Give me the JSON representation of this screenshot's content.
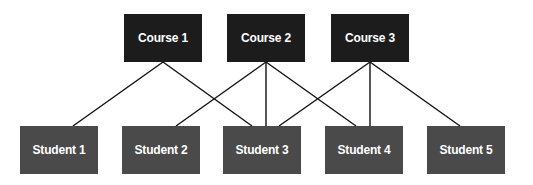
{
  "courses": [
    {
      "label": "Course 1",
      "x": 124,
      "y": 14
    },
    {
      "label": "Course 2",
      "x": 227,
      "y": 14
    },
    {
      "label": "Course 3",
      "x": 331,
      "y": 14
    }
  ],
  "students": [
    {
      "label": "Student 1",
      "x": 20,
      "y": 126
    },
    {
      "label": "Student 2",
      "x": 122,
      "y": 126
    },
    {
      "label": "Student 3",
      "x": 223,
      "y": 126
    },
    {
      "label": "Student 4",
      "x": 325,
      "y": 126
    },
    {
      "label": "Student 5",
      "x": 427,
      "y": 126
    }
  ],
  "edges": [
    {
      "from": "Course 1",
      "to": "Student 1",
      "x1": 163,
      "y1": 62,
      "x2": 73,
      "y2": 126
    },
    {
      "from": "Course 1",
      "to": "Student 3",
      "x1": 163,
      "y1": 62,
      "x2": 252,
      "y2": 126
    },
    {
      "from": "Course 2",
      "to": "Student 2",
      "x1": 266,
      "y1": 62,
      "x2": 176,
      "y2": 126
    },
    {
      "from": "Course 2",
      "to": "Student 3",
      "x1": 266,
      "y1": 62,
      "x2": 266,
      "y2": 126
    },
    {
      "from": "Course 2",
      "to": "Student 4",
      "x1": 266,
      "y1": 62,
      "x2": 356,
      "y2": 126
    },
    {
      "from": "Course 3",
      "to": "Student 3",
      "x1": 370,
      "y1": 62,
      "x2": 279,
      "y2": 126
    },
    {
      "from": "Course 3",
      "to": "Student 4",
      "x1": 370,
      "y1": 62,
      "x2": 370,
      "y2": 126
    },
    {
      "from": "Course 3",
      "to": "Student 5",
      "x1": 370,
      "y1": 62,
      "x2": 460,
      "y2": 126
    }
  ],
  "colors": {
    "course_fill": "#1c1c1c",
    "student_fill": "#4a4a4a",
    "edge": "#111111",
    "text": "#ffffff"
  }
}
